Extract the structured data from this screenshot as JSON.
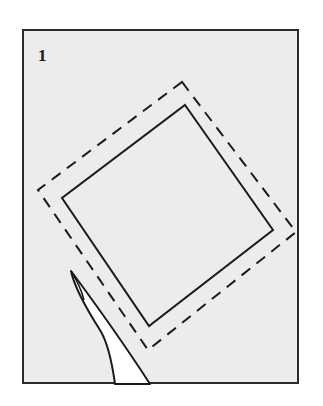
{
  "figure": {
    "step_number": "1",
    "colors": {
      "background": "#ffffff",
      "panel": "#ececec",
      "ink": "#1a1a1a",
      "tool_fill": "#ffffff"
    },
    "shapes": {
      "solid_square": [
        [
          185,
          105
        ],
        [
          273,
          230
        ],
        [
          149,
          326
        ],
        [
          62,
          198
        ]
      ],
      "dashed_square": [
        [
          182,
          82
        ],
        [
          296,
          232
        ],
        [
          148,
          350
        ],
        [
          38,
          190
        ]
      ],
      "tool": "pointed blade / pen tip entering from bottom"
    }
  }
}
